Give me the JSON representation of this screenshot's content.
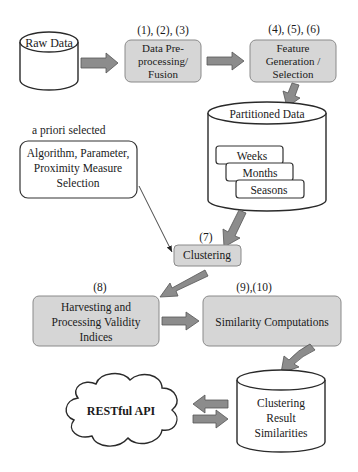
{
  "diagram": {
    "type": "flowchart",
    "colors": {
      "process_box_fill": "#d6d6d6",
      "process_box_stroke": "#8a8a8a",
      "arrow_fill": "#8c8c8c",
      "store_stroke": "#2a2a2a",
      "text": "#1a1a1a"
    },
    "nodes": {
      "raw_data": {
        "label": "Raw Data",
        "shape": "cylinder"
      },
      "preprocessing": {
        "step_label": "(1), (2), (3)",
        "lines": [
          "Data Pre-",
          "processing/",
          "Fusion"
        ],
        "shape": "rounded-box"
      },
      "feature": {
        "step_label": "(4), (5), (6)",
        "lines": [
          "Feature",
          "Generation /",
          "Selection"
        ],
        "shape": "rounded-box"
      },
      "partitioned": {
        "label": "Partitioned Data",
        "shape": "cylinder",
        "partitions": [
          "Weeks",
          "Months",
          "Seasons"
        ]
      },
      "apriori": {
        "caption": "a priori selected",
        "lines": [
          "Algorithm, Parameter,",
          "Proximity Measure",
          "Selection"
        ],
        "shape": "rounded-box-outline"
      },
      "clustering": {
        "step_label": "(7)",
        "label": "Clustering",
        "shape": "rounded-box"
      },
      "harvesting": {
        "step_label": "(8)",
        "lines": [
          "Harvesting and",
          "Processing Validity",
          "Indices"
        ],
        "shape": "rounded-box"
      },
      "similarity": {
        "step_label": "(9),(10)",
        "label": "Similarity Computations",
        "shape": "rounded-box"
      },
      "result_store": {
        "lines": [
          "Clustering",
          "Result",
          "Similarities"
        ],
        "shape": "cylinder"
      },
      "api": {
        "label": "RESTful API",
        "shape": "cloud"
      }
    },
    "edges": [
      {
        "from": "raw_data",
        "to": "preprocessing",
        "style": "block-arrow"
      },
      {
        "from": "preprocessing",
        "to": "feature",
        "style": "block-arrow"
      },
      {
        "from": "feature",
        "to": "partitioned",
        "style": "block-arrow"
      },
      {
        "from": "partitioned",
        "to": "clustering",
        "style": "block-arrow"
      },
      {
        "from": "apriori",
        "to": "clustering",
        "style": "thin-line"
      },
      {
        "from": "clustering",
        "to": "harvesting",
        "style": "block-arrow"
      },
      {
        "from": "harvesting",
        "to": "similarity",
        "style": "block-arrow"
      },
      {
        "from": "similarity",
        "to": "result_store",
        "style": "block-arrow"
      },
      {
        "from": "result_store",
        "to": "api",
        "style": "block-arrow"
      },
      {
        "from": "api",
        "to": "result_store",
        "style": "block-arrow"
      }
    ]
  }
}
